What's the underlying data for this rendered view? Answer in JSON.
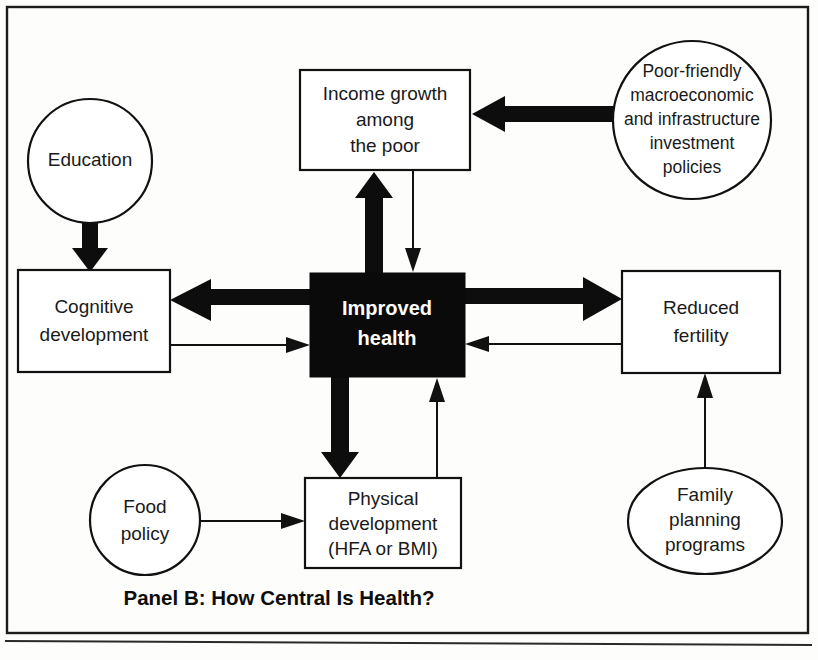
{
  "figure": {
    "panel_title": "Panel B: How Central Is Health?",
    "central_node": {
      "id": "improved-health",
      "lines": [
        "Improved",
        "health"
      ],
      "shape": "rectangle",
      "fill": "#0a0a0a",
      "text_color": "#ffffff"
    },
    "nodes": [
      {
        "id": "education",
        "shape": "circle",
        "lines": [
          "Education"
        ],
        "cx": 90,
        "cy": 161,
        "rx": 62,
        "ry": 62
      },
      {
        "id": "income-growth-among-the-poor",
        "shape": "rectangle",
        "lines": [
          "Income growth",
          "among",
          "the poor"
        ],
        "x": 300,
        "y": 70,
        "w": 170,
        "h": 100
      },
      {
        "id": "poor-friendly-policies",
        "shape": "circle",
        "lines": [
          "Poor-friendly",
          "macroeconomic",
          "and infrastructure",
          "investment",
          "policies"
        ],
        "cx": 692,
        "cy": 120,
        "rx": 79,
        "ry": 79
      },
      {
        "id": "cognitive-development",
        "shape": "rectangle",
        "lines": [
          "Cognitive",
          "development"
        ],
        "x": 18,
        "y": 270,
        "w": 152,
        "h": 102
      },
      {
        "id": "improved-health",
        "shape": "rectangle",
        "lines": [
          "Improved",
          "health"
        ],
        "x": 310,
        "y": 273,
        "w": 155,
        "h": 104
      },
      {
        "id": "reduced-fertility",
        "shape": "rectangle",
        "lines": [
          "Reduced",
          "fertility"
        ],
        "x": 622,
        "y": 271,
        "w": 158,
        "h": 102
      },
      {
        "id": "food-policy",
        "shape": "circle",
        "lines": [
          "Food",
          "policy"
        ],
        "cx": 145,
        "cy": 520,
        "rx": 55,
        "ry": 55
      },
      {
        "id": "physical-development",
        "shape": "rectangle",
        "lines": [
          "Physical",
          "development",
          "(HFA or BMI)"
        ],
        "x": 305,
        "y": 478,
        "w": 156,
        "h": 90
      },
      {
        "id": "family-planning-programs",
        "shape": "ellipse",
        "lines": [
          "Family",
          "planning",
          "programs"
        ],
        "cx": 705,
        "cy": 521,
        "rx": 77,
        "ry": 53
      }
    ],
    "edges": [
      {
        "id": "education-to-cognitive-development",
        "from": "education",
        "to": "cognitive-development",
        "weight": "thick",
        "direction": "down"
      },
      {
        "id": "poor-friendly-policies-to-income-growth",
        "from": "poor-friendly-policies",
        "to": "income-growth-among-the-poor",
        "weight": "thick",
        "direction": "left"
      },
      {
        "id": "improved-health-to-income-growth",
        "from": "improved-health",
        "to": "income-growth-among-the-poor",
        "weight": "thick",
        "direction": "up"
      },
      {
        "id": "income-growth-to-improved-health",
        "from": "income-growth-among-the-poor",
        "to": "improved-health",
        "weight": "thin",
        "direction": "down"
      },
      {
        "id": "improved-health-to-cognitive-development",
        "from": "improved-health",
        "to": "cognitive-development",
        "weight": "thick",
        "direction": "left"
      },
      {
        "id": "cognitive-development-to-improved-health",
        "from": "cognitive-development",
        "to": "improved-health",
        "weight": "thin",
        "direction": "right"
      },
      {
        "id": "improved-health-to-reduced-fertility",
        "from": "improved-health",
        "to": "reduced-fertility",
        "weight": "thick",
        "direction": "right"
      },
      {
        "id": "reduced-fertility-to-improved-health",
        "from": "reduced-fertility",
        "to": "improved-health",
        "weight": "thin",
        "direction": "left"
      },
      {
        "id": "improved-health-to-physical-development",
        "from": "improved-health",
        "to": "physical-development",
        "weight": "thick",
        "direction": "down"
      },
      {
        "id": "physical-development-to-improved-health",
        "from": "physical-development",
        "to": "improved-health",
        "weight": "thin",
        "direction": "up"
      },
      {
        "id": "food-policy-to-physical-development",
        "from": "food-policy",
        "to": "physical-development",
        "weight": "thin",
        "direction": "right"
      },
      {
        "id": "family-planning-to-reduced-fertility",
        "from": "family-planning-programs",
        "to": "reduced-fertility",
        "weight": "thin",
        "direction": "up"
      }
    ],
    "colors": {
      "ink": "#111111",
      "central_fill": "#0a0a0a",
      "paper": "#fdfdfc"
    }
  }
}
